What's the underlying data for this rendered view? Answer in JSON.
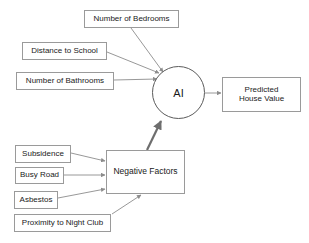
{
  "diagram": {
    "colors": {
      "background": "#ffffff",
      "box_border": "#9a9a9a",
      "circle_border": "#5b5b5b",
      "arrow": "#8c8c8c",
      "arrow_strong": "#6e6e6e",
      "text": "#1a1a1a"
    },
    "nodes": {
      "bedrooms": {
        "label": "Number of Bedrooms",
        "shape": "rectangle"
      },
      "school": {
        "label": "Distance to School",
        "shape": "rectangle"
      },
      "bathrooms": {
        "label": "Number of Bathrooms",
        "shape": "rectangle"
      },
      "ai": {
        "label": "AI",
        "shape": "circle"
      },
      "predicted": {
        "label": "Predicted\nHouse Value",
        "shape": "rectangle"
      },
      "subsidence": {
        "label": "Subsidence",
        "shape": "rectangle"
      },
      "busy_road": {
        "label": "Busy Road",
        "shape": "rectangle"
      },
      "asbestos": {
        "label": "Asbestos",
        "shape": "rectangle"
      },
      "night_club": {
        "label": "Proximity to Night Club",
        "shape": "rectangle"
      },
      "negative_factors": {
        "label": "Negative Factors",
        "shape": "rectangle"
      }
    },
    "edges": [
      {
        "from": "bedrooms",
        "to": "ai"
      },
      {
        "from": "school",
        "to": "ai"
      },
      {
        "from": "bathrooms",
        "to": "ai"
      },
      {
        "from": "ai",
        "to": "predicted"
      },
      {
        "from": "subsidence",
        "to": "negative_factors"
      },
      {
        "from": "busy_road",
        "to": "negative_factors"
      },
      {
        "from": "asbestos",
        "to": "negative_factors"
      },
      {
        "from": "night_club",
        "to": "negative_factors"
      },
      {
        "from": "negative_factors",
        "to": "ai"
      }
    ]
  }
}
